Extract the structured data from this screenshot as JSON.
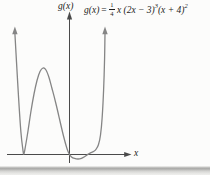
{
  "figure": {
    "y_axis_label": "g(x)",
    "x_axis_label": "x"
  },
  "equation": {
    "lhs": "g(x)",
    "equals": "=",
    "frac_num": "1",
    "frac_den": "4",
    "term_a": "x (2x − 3)",
    "exp_a": "3",
    "term_b": "(x + 4)",
    "exp_b": "2"
  },
  "colors": {
    "background": "#fcfcfb",
    "curve": "#858585",
    "axis": "#4a4a4a",
    "text": "#1c1c1c"
  },
  "chart_data": {
    "type": "line",
    "xlabel": "x",
    "ylabel": "g(x)",
    "x_intercepts": [
      -4,
      0,
      1.5
    ],
    "root_multiplicities": [
      [
        -4,
        2
      ],
      [
        0,
        1
      ],
      [
        1.5,
        3
      ]
    ],
    "degree": 6,
    "end_behavior": "rises to +infinity on both ends",
    "grid": false,
    "legend": false,
    "features": [
      "touches x-axis and bounces at x = -4 (double root)",
      "local maximum hump between x = -4 and x = 0",
      "crosses x-axis at x = 0",
      "shallow dip below the axis on (0, 1.5)",
      "flattened crossing at x = 1.5 (triple root)",
      "arrows upward on both outer branches"
    ],
    "axes_px": {
      "origin": [
        69.5,
        154.5
      ],
      "y_axis": {
        "x": 69.5,
        "y_top": 17,
        "y_bottom": 163
      },
      "x_axis": {
        "y": 154.5,
        "x_left": 7,
        "x_right": 126
      },
      "px_per_unit_x": 11.4
    },
    "sketch_points_px": [
      [
        14.9,
        33.5
      ],
      [
        16.5,
        62
      ],
      [
        18.6,
        98
      ],
      [
        20.9,
        132
      ],
      [
        22.8,
        149
      ],
      [
        23.8,
        154
      ],
      [
        25.5,
        146
      ],
      [
        28,
        131
      ],
      [
        31,
        111
      ],
      [
        34,
        94
      ],
      [
        37,
        80.5
      ],
      [
        40,
        71.5
      ],
      [
        43,
        68
      ],
      [
        46,
        70
      ],
      [
        49,
        77.5
      ],
      [
        52,
        88.5
      ],
      [
        55.5,
        102
      ],
      [
        59.5,
        119
      ],
      [
        63.5,
        136
      ],
      [
        66.8,
        148
      ],
      [
        68.8,
        153.2
      ],
      [
        71.5,
        156.9
      ],
      [
        74.5,
        158.4
      ],
      [
        78,
        159
      ],
      [
        81.5,
        158.3
      ],
      [
        84.5,
        156.8
      ],
      [
        87.5,
        154.6
      ],
      [
        90.5,
        152.9
      ],
      [
        93.5,
        151.5
      ],
      [
        96,
        149.3
      ],
      [
        98.5,
        144.5
      ],
      [
        100.5,
        135
      ],
      [
        102.2,
        117
      ],
      [
        103.6,
        90
      ],
      [
        104.6,
        58
      ],
      [
        105,
        33.5
      ]
    ]
  }
}
